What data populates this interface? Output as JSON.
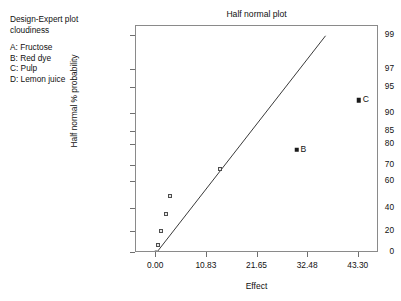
{
  "legend": {
    "header_line1": "Design-Expert plot",
    "header_line2": "cloudiness",
    "factors": [
      "A: Fructose",
      "B: Red dye",
      "C: Pulp",
      "D: Lemon juice"
    ]
  },
  "chart_data": {
    "type": "scatter",
    "title": "Half normal plot",
    "xlabel": "Effect",
    "ylabel": "Half normal % probability",
    "xlim": [
      -4.33,
      47.63
    ],
    "ylim": [
      0,
      99
    ],
    "grid": false,
    "legend_position": "none",
    "xticks": [
      "0.00",
      "10.83",
      "21.65",
      "32.48",
      "43.30"
    ],
    "xtick_values": [
      0.0,
      10.83,
      21.65,
      32.48,
      43.3
    ],
    "yticks": [
      "0",
      "20",
      "40",
      "60",
      "70",
      "80",
      "85",
      "90",
      "95",
      "97",
      "99"
    ],
    "ytick_values": [
      0,
      20,
      40,
      60,
      70,
      80,
      85,
      90,
      95,
      97,
      99
    ],
    "points": [
      {
        "x": 0.0,
        "y": 0,
        "marker": "filled-circle",
        "label": ""
      },
      {
        "x": 0.35,
        "y": 8,
        "marker": "open-square",
        "label": ""
      },
      {
        "x": 1.1,
        "y": 21,
        "marker": "open-square",
        "label": ""
      },
      {
        "x": 2.0,
        "y": 36,
        "marker": "open-square",
        "label": ""
      },
      {
        "x": 2.9,
        "y": 50,
        "marker": "open-square",
        "label": ""
      },
      {
        "x": 13.6,
        "y": 68,
        "marker": "open-square",
        "label": ""
      },
      {
        "x": 30.0,
        "y": 78,
        "marker": "filled-square",
        "label": "B"
      },
      {
        "x": 43.3,
        "y": 93,
        "marker": "filled-square",
        "label": "C"
      }
    ],
    "reference_line": {
      "description": "half-normal reference line through origin",
      "x_start": 0.0,
      "y_start": 0,
      "x_end": 36.2,
      "y_end": 99
    },
    "colors": {
      "frame": "#8a8a8a",
      "line": "#3a3a3a",
      "marker_open_fill": "#e8e8e8",
      "marker_open_edge": "#4d4d4d",
      "marker_filled": "#1a1a1a",
      "text": "#111111",
      "background": "#ffffff"
    }
  }
}
